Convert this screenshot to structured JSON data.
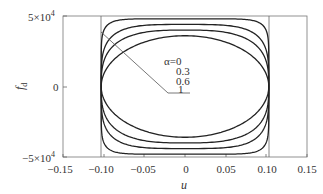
{
  "chart_data": {
    "type": "line",
    "title": "",
    "xlabel": "u",
    "ylabel": "f_d",
    "xlim": [
      -0.15,
      0.15
    ],
    "ylim": [
      -50000,
      50000
    ],
    "x_ticks": [
      "-0.15",
      "-0.10",
      "-0.05",
      "0",
      "0.05",
      "0.10",
      "0.15"
    ],
    "y_ticks": [
      "5×10⁴",
      "0",
      "−5×10⁴"
    ],
    "grid": false,
    "vertical_reference_lines": [
      -0.103,
      0.103
    ],
    "series": [
      {
        "name": "α=0",
        "shape": "closed loop",
        "u_amplitude": 0.103,
        "f_amplitude": 48000,
        "exponent": 8
      },
      {
        "name": "α=0.3",
        "shape": "closed loop",
        "u_amplitude": 0.103,
        "f_amplitude": 44000,
        "exponent": 4
      },
      {
        "name": "α=0.6",
        "shape": "closed loop",
        "u_amplitude": 0.103,
        "f_amplitude": 40000,
        "exponent": 3
      },
      {
        "name": "α=1",
        "shape": "ellipse",
        "u_amplitude": 0.103,
        "f_amplitude": 36000,
        "exponent": 2
      }
    ],
    "annotations": [
      "α=0",
      "0.3",
      "0.6",
      "1"
    ],
    "legend_position": "inline leader-line annotation"
  },
  "labels": {
    "xlabel": "u",
    "ylabel_main": "f",
    "ylabel_sub": "d",
    "x_ticks": [
      "−0.15",
      "−0.10",
      "−0.05",
      "0",
      "0.05",
      "0.10",
      "0.15"
    ],
    "y_top": "5×10",
    "y_top_exp": "4",
    "y_zero": "0",
    "y_bottom": "−5×10",
    "y_bottom_exp": "4",
    "annot_0": "α=0",
    "annot_1": "0.3",
    "annot_2": "0.6",
    "annot_3": "1"
  }
}
